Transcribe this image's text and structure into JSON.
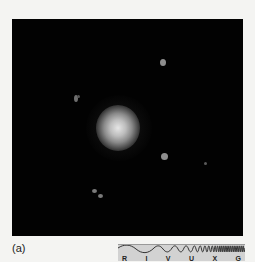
{
  "figure": {
    "panel_label": "(a)",
    "image_description": "Dark astronomical image with a bright diffuse central galaxy and several faint point sources",
    "colors": {
      "background": "#f4f4f2",
      "image_background": "#020202",
      "spectrum_bar": "#d2d2d2"
    }
  },
  "spectrum_bar": {
    "bands": [
      "R",
      "I",
      "V",
      "U",
      "X",
      "G"
    ]
  }
}
